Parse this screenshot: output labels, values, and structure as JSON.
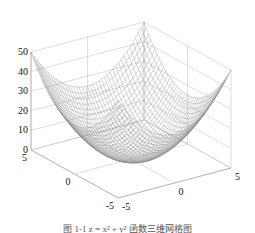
{
  "chart_data": {
    "type": "surface",
    "title": "",
    "function": "z = x^2 + y^2",
    "x": {
      "label": "",
      "range": [
        -5,
        5
      ],
      "ticks": [
        -5,
        0,
        5
      ]
    },
    "y": {
      "label": "",
      "range": [
        -5,
        5
      ],
      "ticks": [
        -5,
        0,
        5
      ]
    },
    "z": {
      "label": "",
      "range": [
        0,
        50
      ],
      "ticks": [
        0,
        10,
        20,
        30,
        40,
        50
      ]
    },
    "grid": true,
    "mesh_resolution": 41,
    "colors": {
      "mesh": "#8a8a8a",
      "grid": "#c8c8c8",
      "axis": "#b0b0b0",
      "text": "#111111"
    },
    "view": {
      "front_corner": [
        118,
        198
      ],
      "left_corner": [
        31,
        150
      ],
      "right_corner": [
        231,
        168
      ],
      "z_pixel_height": 98
    }
  },
  "caption": "图 1-1  z = x² + y² 函数三维网格图"
}
